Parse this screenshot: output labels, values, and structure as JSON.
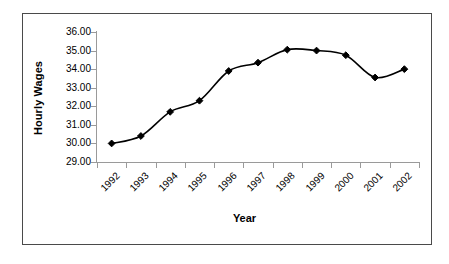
{
  "chart_data": {
    "type": "line",
    "title": "",
    "xlabel": "Year",
    "ylabel": "Hourly Wages",
    "categories": [
      "1992",
      "1993",
      "1994",
      "1995",
      "1996",
      "1997",
      "1998",
      "1999",
      "2000",
      "2001",
      "2002"
    ],
    "values": [
      30.0,
      30.4,
      31.7,
      32.3,
      33.9,
      34.35,
      35.05,
      35.0,
      34.75,
      33.55,
      34.0
    ],
    "series": [
      {
        "name": "Hourly Wages",
        "values": [
          30.0,
          30.4,
          31.7,
          32.3,
          33.9,
          34.35,
          35.05,
          35.0,
          34.75,
          33.55,
          34.0
        ]
      }
    ],
    "ylim": [
      29.0,
      36.0
    ],
    "ytick_values": [
      36.0,
      35.0,
      34.0,
      33.0,
      32.0,
      31.0,
      30.0,
      29.0
    ],
    "ytick_labels": [
      "36.00",
      "35.00",
      "34.00",
      "33.00",
      "32.00",
      "31.00",
      "30.00",
      "29.00"
    ],
    "grid": false,
    "legend": "none",
    "marker": "diamond",
    "line_color": "#000000",
    "marker_color": "#000000",
    "axis_color": "#9a9a9a",
    "border_color": "#4a4a4a",
    "background": "#ffffff",
    "smoothed_line": true,
    "xlabel_rotation": -45
  }
}
